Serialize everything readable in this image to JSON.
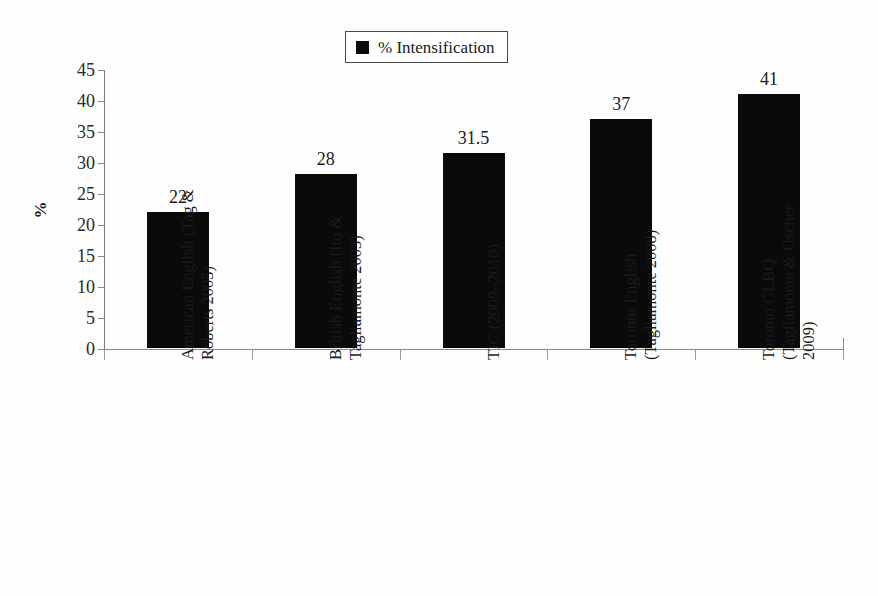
{
  "legend": {
    "marker": "black-square",
    "label": "% Intensification"
  },
  "axes": {
    "y_title": "%",
    "y_ticks": [
      "45",
      "40",
      "35",
      "30",
      "25",
      "20",
      "15",
      "10",
      "5",
      "0"
    ]
  },
  "categories": [
    {
      "lines": [
        "American English (Tag &",
        "Roberts 2005)"
      ]
    },
    {
      "lines": [
        "British English (Ito &",
        "Tagliamonte 2003)"
      ]
    },
    {
      "lines": [
        "TIC (2009–2010)"
      ]
    },
    {
      "lines": [
        "Toronto English",
        "(Tagliamonte 2008)"
      ]
    },
    {
      "lines": [
        "Toronto GLBQ",
        "(Tagliamonte & Uscher",
        "2009)"
      ]
    }
  ],
  "bar_labels": [
    "22",
    "28",
    "31.5",
    "37",
    "41"
  ],
  "colors": {
    "bar": "#0a0a0a",
    "axis": "#8a8a8a",
    "text": "#1b1b1b",
    "background": "#fdfdfd"
  },
  "chart_data": {
    "type": "bar",
    "title": "",
    "subtitle": "",
    "xlabel": "",
    "ylabel": "%",
    "ylim": [
      0,
      45
    ],
    "ytick_step": 5,
    "grid": false,
    "legend_position": "top-center",
    "categories": [
      "American English (Tag & Roberts 2005)",
      "British English (Ito & Tagliamonte 2003)",
      "TIC (2009–2010)",
      "Toronto English (Tagliamonte 2008)",
      "Toronto GLBQ (Tagliamonte & Uscher 2009)"
    ],
    "series": [
      {
        "name": "% Intensification",
        "values": [
          22,
          28,
          31.5,
          37,
          41
        ],
        "color": "#0a0a0a"
      }
    ],
    "data_labels": [
      "22",
      "28",
      "31.5",
      "37",
      "41"
    ]
  }
}
